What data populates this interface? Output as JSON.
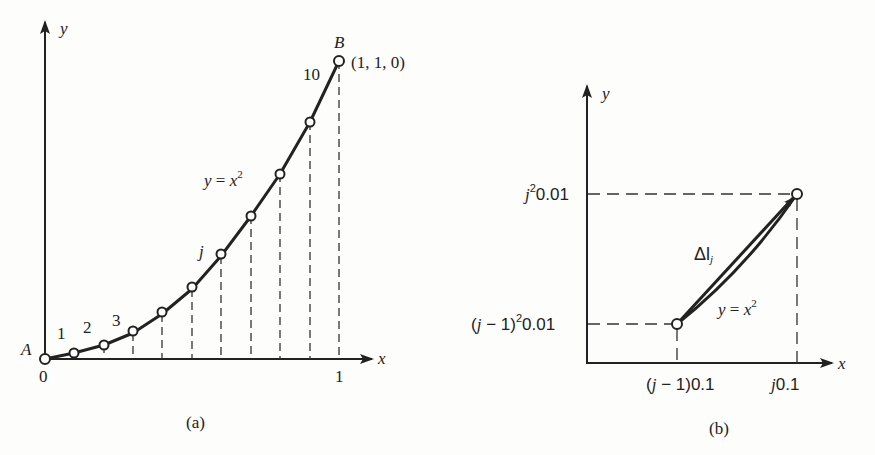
{
  "panel_a": {
    "caption": "(a)",
    "y_axis_label": "y",
    "x_axis_label": "x",
    "origin_label": "0",
    "x_tick_one": "1",
    "point_A_label": "A",
    "point_B_label": "B",
    "point_B_coords": "(1, 1, 0)",
    "curve_label_lhs": "y",
    "curve_label_eq": " = ",
    "curve_label_rhs": "x",
    "curve_label_exp": "2",
    "segment_labels": [
      "1",
      "2",
      "3"
    ],
    "segment_j_label": "j",
    "segment_last_label": "10",
    "points_x": [
      0,
      0.1,
      0.2,
      0.3,
      0.4,
      0.5,
      0.6,
      0.7,
      0.8,
      0.9,
      1.0
    ]
  },
  "panel_b": {
    "caption": "(b)",
    "y_axis_label": "y",
    "x_axis_label": "x",
    "y_tick_upper_j": "j",
    "y_tick_upper_exp": "2",
    "y_tick_upper_val": "0.01",
    "y_tick_lower_pre": "(",
    "y_tick_lower_j": "j",
    "y_tick_lower_mid": " − 1)",
    "y_tick_lower_exp": "2",
    "y_tick_lower_val": "0.01",
    "x_tick_left_pre": "(",
    "x_tick_left_j": "j",
    "x_tick_left_post": " − 1)0.1",
    "x_tick_right_j": "j",
    "x_tick_right_val": "0.1",
    "delta_label": "Δl",
    "delta_sub": "j",
    "curve_label_lhs": "y",
    "curve_label_eq": " = ",
    "curve_label_rhs": "x",
    "curve_label_exp": "2"
  }
}
